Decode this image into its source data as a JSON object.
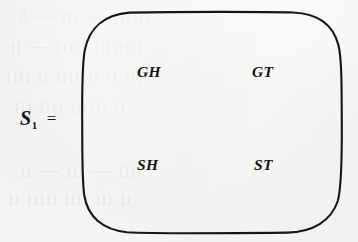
{
  "figure": {
    "kind": "set-diagram",
    "background_color": "#f6f6f4",
    "ink_color": "#141414",
    "label": {
      "symbol": "S",
      "subscript": "1",
      "equals": "="
    },
    "set": {
      "shape": "rounded-rectangle",
      "members": [
        {
          "id": "member-gh",
          "text": "GH"
        },
        {
          "id": "member-gt",
          "text": "GT"
        },
        {
          "id": "member-sh",
          "text": "SH"
        },
        {
          "id": "member-st",
          "text": "ST"
        }
      ]
    },
    "ghost_text": [
      {
        "text": "é — ııı — ıııııı",
        "x": 18,
        "y": 14
      },
      {
        "text": "ıı — ııııı ıııııııı",
        "x": 10,
        "y": 44
      },
      {
        "text": "ıııı ıı ııııııı ıı ııı",
        "x": 6,
        "y": 74
      },
      {
        "text": "ııı ıııı ıııııı ıı",
        "x": 14,
        "y": 104
      },
      {
        "text": "ıı — ııı — ıııı",
        "x": 20,
        "y": 168
      },
      {
        "text": "ıı ııııı ıııı ııı ıı",
        "x": 8,
        "y": 196
      }
    ]
  }
}
